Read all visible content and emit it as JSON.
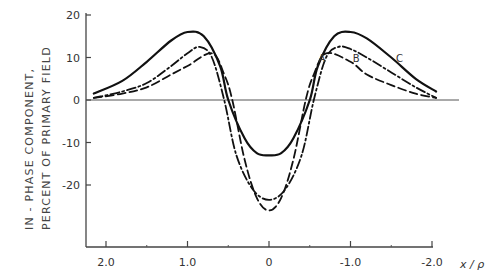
{
  "chart_data": {
    "type": "line",
    "title": "",
    "xlabel": "x / ρ",
    "ylabel_lines": [
      "IN - PHASE  COMPONENT,",
      "PERCENT OF PRIMARY FIELD"
    ],
    "xlim": [
      2.2,
      -2.1
    ],
    "ylim": [
      -35,
      20
    ],
    "x_ticks": [
      2.0,
      1.0,
      0,
      -1.0,
      -2.0
    ],
    "x_tick_labels": [
      "2.0",
      "1.0",
      "0",
      "-1.0",
      "-2.0"
    ],
    "x_minor_ticks": [
      1.5,
      0.5,
      -0.5,
      -1.5
    ],
    "y_ticks": [
      20,
      10,
      0,
      -10,
      -20
    ],
    "y_tick_labels": [
      "20",
      "10",
      "0",
      "-10",
      "-20"
    ],
    "grid": false,
    "zero_line": true,
    "legend": "inline curve labels A, B, C",
    "series": [
      {
        "name": "C",
        "style": "solid",
        "x": [
          2.15,
          1.8,
          1.5,
          1.2,
          1.0,
          0.8,
          0.6,
          0.5,
          0.3,
          0.15,
          0,
          -0.15,
          -0.3,
          -0.5,
          -0.6,
          -0.8,
          -1.0,
          -1.2,
          -1.5,
          -1.8,
          -2.05
        ],
        "values": [
          1.5,
          4.5,
          9,
          14,
          16,
          15,
          8,
          0,
          -9,
          -12.5,
          -13,
          -12.5,
          -9,
          0,
          8,
          15,
          16,
          14.5,
          10,
          5,
          2
        ]
      },
      {
        "name": "B",
        "style": "dash-dot",
        "x": [
          2.15,
          1.8,
          1.5,
          1.2,
          1.0,
          0.85,
          0.7,
          0.55,
          0.4,
          0.2,
          0,
          -0.2,
          -0.4,
          -0.55,
          -0.7,
          -0.85,
          -1.0,
          -1.2,
          -1.5,
          -1.8,
          -2.05
        ],
        "values": [
          0.5,
          2,
          4,
          8,
          11,
          12.5,
          10,
          0,
          -13,
          -21,
          -23.5,
          -21,
          -13,
          0,
          10,
          12.5,
          12,
          10,
          6.5,
          3,
          0.5
        ]
      },
      {
        "name": "A",
        "style": "dashed",
        "x": [
          2.15,
          1.8,
          1.5,
          1.2,
          1.0,
          0.7,
          0.55,
          0.45,
          0.3,
          0.15,
          0,
          -0.15,
          -0.3,
          -0.45,
          -0.55,
          -0.7,
          -1.0,
          -1.2,
          -1.5,
          -1.8,
          -2.05
        ],
        "values": [
          0.5,
          1.5,
          3,
          6,
          8,
          11,
          6,
          0,
          -14,
          -23,
          -26,
          -23,
          -14,
          0,
          6,
          11,
          9,
          6,
          3.5,
          1.5,
          0.5
        ]
      }
    ],
    "annotations": [
      {
        "text": "A",
        "x": -0.65,
        "y": 9
      },
      {
        "text": "B",
        "x": -1.07,
        "y": 9
      },
      {
        "text": "C",
        "x": -1.6,
        "y": 9
      }
    ]
  }
}
